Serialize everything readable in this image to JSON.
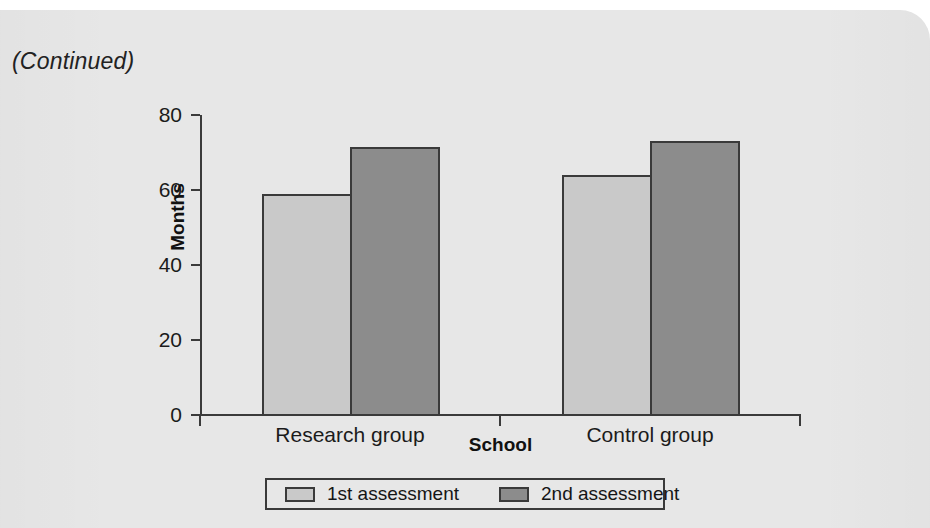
{
  "page": {
    "continued_note": "(Continued)",
    "background_color": "#e7e7e7"
  },
  "chart_data": {
    "type": "bar",
    "title": "",
    "subtitle": "",
    "xlabel": "School",
    "ylabel": "Months",
    "categories": [
      "Research group",
      "Control group"
    ],
    "series": [
      {
        "name": "1st assessment",
        "values": [
          59,
          64
        ],
        "color": "#c9c9c9"
      },
      {
        "name": "2nd assessment",
        "values": [
          71.5,
          73
        ],
        "color": "#8c8c8c"
      }
    ],
    "ylim": [
      0,
      80
    ],
    "ytick_labels": [
      "0",
      "20",
      "40",
      "60",
      "80"
    ],
    "ytick_values": [
      0,
      20,
      40,
      60,
      80
    ],
    "grid": false,
    "legend_position": "bottom",
    "legend_entries": [
      "1st assessment",
      "2nd assessment"
    ],
    "axis_color": "#3b3b3b",
    "bar_border_color": "#3a3a3a"
  }
}
